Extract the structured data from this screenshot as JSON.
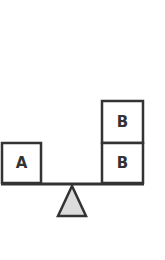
{
  "diagram": {
    "type": "balance-scale",
    "left_pan": {
      "boxes": [
        {
          "label": "A"
        }
      ]
    },
    "right_pan": {
      "boxes": [
        {
          "label": "B"
        },
        {
          "label": "B"
        }
      ]
    },
    "colors": {
      "stroke": "#333333",
      "box_fill": "#ffffff",
      "fulcrum_fill": "#dcdcdc",
      "background": "#ffffff"
    }
  }
}
